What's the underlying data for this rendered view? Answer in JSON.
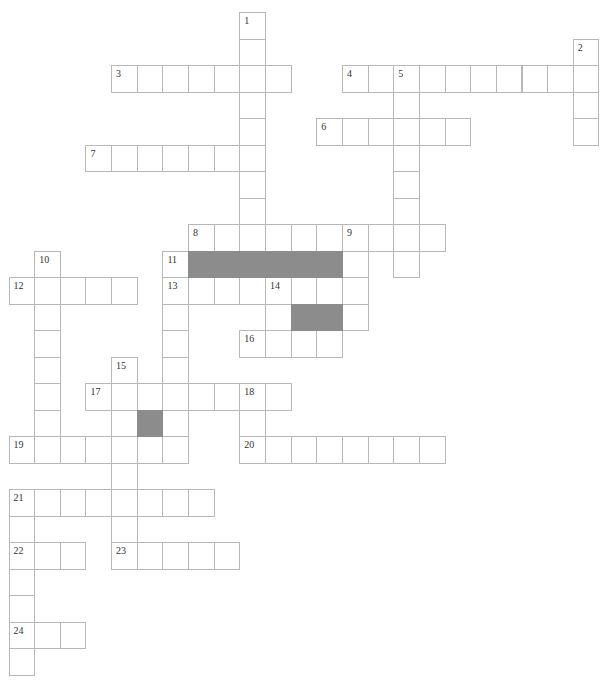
{
  "puzzle": {
    "type": "crossword",
    "cell_width": 25.65,
    "cell_height": 26.5,
    "origin_x": 8.5,
    "origin_y": 12,
    "colors": {
      "cell_fill": "#ffffff",
      "cell_border": "#b8b8b8",
      "block_fill": "#8c8c8c"
    },
    "across": [
      {
        "number": "3",
        "row": 2,
        "col": 4,
        "length": 7
      },
      {
        "number": "4",
        "row": 2,
        "col": 13,
        "length": 10
      },
      {
        "number": "6",
        "row": 4,
        "col": 12,
        "length": 6
      },
      {
        "number": "7",
        "row": 5,
        "col": 3,
        "length": 7
      },
      {
        "number": "8",
        "row": 8,
        "col": 7,
        "length": 10
      },
      {
        "number": "12",
        "row": 10,
        "col": 0,
        "length": 5
      },
      {
        "number": "13",
        "row": 10,
        "col": 6,
        "length": 8
      },
      {
        "number": "16",
        "row": 12,
        "col": 9,
        "length": 4
      },
      {
        "number": "17",
        "row": 14,
        "col": 3,
        "length": 8
      },
      {
        "number": "19",
        "row": 16,
        "col": 0,
        "length": 7
      },
      {
        "number": "20",
        "row": 16,
        "col": 9,
        "length": 8
      },
      {
        "number": "21",
        "row": 18,
        "col": 0,
        "length": 8
      },
      {
        "number": "22",
        "row": 20,
        "col": 0,
        "length": 3
      },
      {
        "number": "23",
        "row": 20,
        "col": 4,
        "length": 5
      },
      {
        "number": "24",
        "row": 23,
        "col": 0,
        "length": 3
      }
    ],
    "down": [
      {
        "number": "1",
        "row": 0,
        "col": 9,
        "length": 9
      },
      {
        "number": "2",
        "row": 1,
        "col": 22,
        "length": 4
      },
      {
        "number": "5",
        "row": 2,
        "col": 15,
        "length": 8
      },
      {
        "number": "9",
        "row": 8,
        "col": 13,
        "length": 4
      },
      {
        "number": "10",
        "row": 9,
        "col": 1,
        "length": 8
      },
      {
        "number": "11",
        "row": 9,
        "col": 6,
        "length": 8
      },
      {
        "number": "14",
        "row": 10,
        "col": 10,
        "length": 3
      },
      {
        "number": "15",
        "row": 13,
        "col": 4,
        "length": 8
      },
      {
        "number": "18",
        "row": 14,
        "col": 9,
        "length": 3
      },
      {
        "number": "21",
        "row": 18,
        "col": 0,
        "length": 7
      }
    ],
    "blocks": [
      {
        "row": 9,
        "col": 7
      },
      {
        "row": 9,
        "col": 8
      },
      {
        "row": 9,
        "col": 9
      },
      {
        "row": 9,
        "col": 10
      },
      {
        "row": 9,
        "col": 11
      },
      {
        "row": 9,
        "col": 12
      },
      {
        "row": 11,
        "col": 11
      },
      {
        "row": 11,
        "col": 12
      },
      {
        "row": 15,
        "col": 5
      }
    ]
  }
}
